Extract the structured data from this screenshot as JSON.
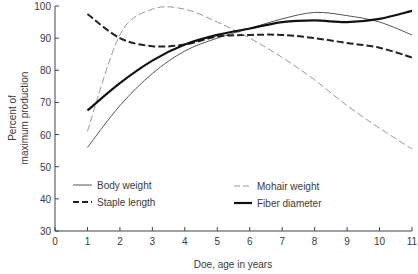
{
  "chart_data": {
    "type": "line",
    "title": "",
    "xlabel": "Doe, age in years",
    "ylabel": "Percent of maximum production",
    "ylabel_lines": [
      "Percent of",
      "maximum production"
    ],
    "xlim": [
      0,
      11
    ],
    "ylim": [
      30,
      100
    ],
    "x_ticks": [
      0,
      1,
      2,
      3,
      4,
      5,
      6,
      7,
      8,
      9,
      10,
      11
    ],
    "y_ticks": [
      30,
      40,
      50,
      60,
      70,
      80,
      90,
      100
    ],
    "grid": false,
    "legend_position": "lower-inside",
    "x": [
      1,
      2,
      3,
      4,
      5,
      6,
      7,
      8,
      9,
      10,
      11
    ],
    "series": [
      {
        "name": "Body weight",
        "style": "thin-solid",
        "values": [
          56,
          69,
          79,
          86,
          90,
          93,
          96,
          98,
          97,
          95,
          91
        ]
      },
      {
        "name": "Staple length",
        "style": "thick-dashed",
        "values": [
          97.5,
          90,
          87.5,
          88,
          90.5,
          91,
          91,
          90,
          88.5,
          87,
          84
        ]
      },
      {
        "name": "Mohair weight",
        "style": "thin-dashed-gray",
        "values": [
          61,
          91,
          99,
          99,
          95,
          90,
          84,
          77,
          69,
          62,
          55.5
        ]
      },
      {
        "name": "Fiber diameter",
        "style": "thick-solid",
        "values": [
          67.5,
          76,
          83,
          88,
          91,
          93,
          95,
          95.5,
          95,
          96,
          98.5
        ]
      }
    ]
  },
  "legend": {
    "body_weight": "Body weight",
    "staple_length": "Staple length",
    "mohair_weight": "Mohair weight",
    "fiber_diameter": "Fiber diameter"
  },
  "axes": {
    "x_label": "Doe, age in years",
    "y_label_line1": "Percent of",
    "y_label_line2": "maximum production",
    "x_tick_labels": [
      "0",
      "1",
      "2",
      "3",
      "4",
      "5",
      "6",
      "7",
      "8",
      "9",
      "10",
      "11"
    ],
    "y_tick_labels": [
      "30",
      "40",
      "50",
      "60",
      "70",
      "80",
      "90",
      "100"
    ]
  }
}
